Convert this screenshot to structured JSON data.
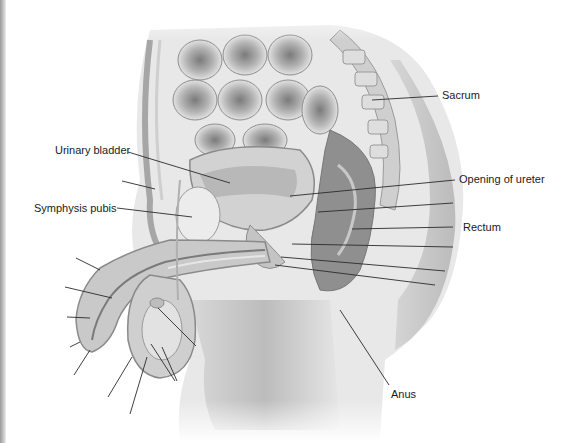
{
  "diagram": {
    "labels": [
      {
        "id": "sacrum",
        "text": "Sacrum",
        "x": 442,
        "y": 62
      },
      {
        "id": "urinary-bladder",
        "text": "Urinary bladder",
        "x": 55,
        "y": 145
      },
      {
        "id": "opening-of-ureter",
        "text": "Opening of ureter",
        "x": 458,
        "y": 175
      },
      {
        "id": "symphysis-pubis",
        "text": "Symphysis pubis",
        "x": 34,
        "y": 202
      },
      {
        "id": "rectum",
        "text": "Rectum",
        "x": 462,
        "y": 220
      },
      {
        "id": "anus",
        "text": "Anus",
        "x": 391,
        "y": 388
      }
    ],
    "leader_lines": [
      {
        "id": "sacrum-line",
        "x1": 438,
        "y1": 96,
        "x2": 372,
        "y2": 100
      },
      {
        "id": "urinary-bladder-line",
        "x1": 128,
        "y1": 152,
        "x2": 230,
        "y2": 183
      },
      {
        "id": "opening-of-ureter-line",
        "x1": 455,
        "y1": 180,
        "x2": 290,
        "y2": 196
      },
      {
        "id": "unlabeled-1",
        "x1": 453,
        "y1": 203,
        "x2": 318,
        "y2": 212
      },
      {
        "id": "symphysis-pubis-line",
        "x1": 117,
        "y1": 208,
        "x2": 192,
        "y2": 217
      },
      {
        "id": "rectum-line",
        "x1": 453,
        "y1": 227,
        "x2": 352,
        "y2": 229
      },
      {
        "id": "unlabeled-2",
        "x1": 453,
        "y1": 247,
        "x2": 292,
        "y2": 244
      },
      {
        "id": "unlabeled-3",
        "x1": 445,
        "y1": 271,
        "x2": 281,
        "y2": 257
      },
      {
        "id": "unlabeled-4",
        "x1": 435,
        "y1": 285,
        "x2": 275,
        "y2": 265
      },
      {
        "id": "anus-line",
        "x1": 389,
        "y1": 388,
        "x2": 340,
        "y2": 310
      },
      {
        "id": "unlabeled-left-1",
        "x1": 122,
        "y1": 181,
        "x2": 155,
        "y2": 189
      },
      {
        "id": "unlabeled-left-2",
        "x1": 76,
        "y1": 258,
        "x2": 100,
        "y2": 270
      },
      {
        "id": "unlabeled-left-3",
        "x1": 65,
        "y1": 287,
        "x2": 112,
        "y2": 298
      },
      {
        "id": "unlabeled-left-4",
        "x1": 67,
        "y1": 317,
        "x2": 90,
        "y2": 318
      },
      {
        "id": "unlabeled-left-5",
        "x1": 70,
        "y1": 347,
        "x2": 80,
        "y2": 342
      },
      {
        "id": "unlabeled-left-6",
        "x1": 74,
        "y1": 375,
        "x2": 90,
        "y2": 350
      },
      {
        "id": "unlabeled-scrotum-1",
        "x1": 108,
        "y1": 397,
        "x2": 132,
        "y2": 357
      },
      {
        "id": "unlabeled-scrotum-2",
        "x1": 130,
        "y1": 414,
        "x2": 147,
        "y2": 357
      },
      {
        "id": "unlabeled-testis-1",
        "x1": 196,
        "y1": 346,
        "x2": 158,
        "y2": 308
      },
      {
        "id": "unlabeled-testis-2",
        "x1": 175,
        "y1": 381,
        "x2": 151,
        "y2": 344
      },
      {
        "id": "unlabeled-testis-3",
        "x1": 177,
        "y1": 381,
        "x2": 162,
        "y2": 347
      }
    ],
    "colors": {
      "background": "#ffffff",
      "line": "#2a2a2a",
      "text": "#1a1a1a",
      "tissue_light": "#e4e4e4",
      "tissue_mid": "#bdbdbd",
      "tissue_dark": "#8a8a8a"
    }
  }
}
